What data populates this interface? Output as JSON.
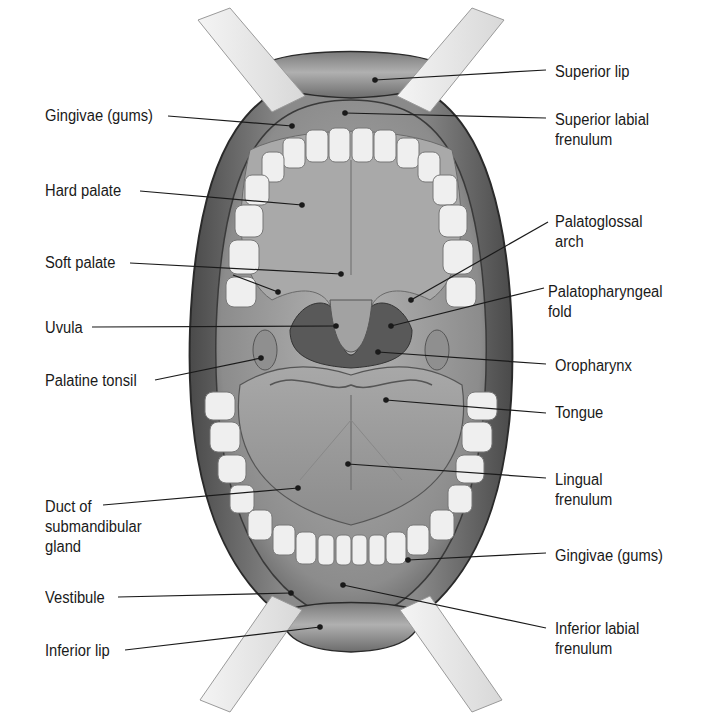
{
  "figure": {
    "colors": {
      "background": "#ffffff",
      "lip": "#8a8a8a",
      "cheek_wall": "#6e6e6e",
      "palate": "#a6a6a6",
      "oropharynx": "#5a5a5a",
      "tongue": "#9b9b9b",
      "teeth": "#efefef",
      "retractor": "#e2e2e2",
      "leader_line": "#1a1a1a",
      "label_text": "#1a1a1a"
    }
  },
  "labels": {
    "left": [
      {
        "id": "gingivae_upper",
        "text": "Gingivae (gums)",
        "x": 45,
        "y": 106,
        "line": [
          168,
          116,
          292,
          126
        ]
      },
      {
        "id": "hard_palate",
        "text": "Hard palate",
        "x": 45,
        "y": 181,
        "line": [
          140,
          191,
          302,
          205
        ]
      },
      {
        "id": "soft_palate",
        "text": "Soft palate",
        "x": 45,
        "y": 253,
        "line": [
          130,
          263,
          341,
          274
        ],
        "line2": [
          233,
          275,
          278,
          292
        ]
      },
      {
        "id": "uvula",
        "text": "Uvula",
        "x": 45,
        "y": 318,
        "line": [
          92,
          327,
          336,
          326
        ]
      },
      {
        "id": "palatine_tonsil",
        "text": "Palatine tonsil",
        "x": 45,
        "y": 371,
        "line": [
          155,
          380,
          261,
          358
        ]
      },
      {
        "id": "duct_submandibular",
        "text": "Duct of\nsubmandibular\ngland",
        "x": 45,
        "y": 497,
        "line": [
          103,
          505,
          298,
          488
        ]
      },
      {
        "id": "vestibule",
        "text": "Vestibule",
        "x": 45,
        "y": 588,
        "line": [
          118,
          597,
          291,
          593
        ]
      },
      {
        "id": "inferior_lip",
        "text": "Inferior lip",
        "x": 45,
        "y": 641,
        "line": [
          125,
          650,
          320,
          627
        ]
      }
    ],
    "right": [
      {
        "id": "superior_lip",
        "text": "Superior lip",
        "x": 555,
        "y": 62,
        "line": [
          375,
          80,
          546,
          70
        ]
      },
      {
        "id": "superior_labial_frenulum",
        "text": "Superior labial\nfrenulum",
        "x": 555,
        "y": 110,
        "line": [
          345,
          113,
          546,
          118
        ]
      },
      {
        "id": "palatoglossal_arch",
        "text": "Palatoglossal\narch",
        "x": 555,
        "y": 212,
        "line": [
          411,
          300,
          548,
          222
        ]
      },
      {
        "id": "palatopharyngeal_fold",
        "text": "Palatopharyngeal\nfold",
        "x": 548,
        "y": 282,
        "line": [
          391,
          326,
          544,
          288
        ]
      },
      {
        "id": "oropharynx",
        "text": "Oropharynx",
        "x": 555,
        "y": 356,
        "line": [
          378,
          352,
          546,
          364
        ]
      },
      {
        "id": "tongue",
        "text": "Tongue",
        "x": 555,
        "y": 403,
        "line": [
          386,
          400,
          546,
          413
        ]
      },
      {
        "id": "lingual_frenulum",
        "text": "Lingual\nfrenulum",
        "x": 555,
        "y": 470,
        "line": [
          348,
          464,
          546,
          478
        ]
      },
      {
        "id": "gingivae_lower",
        "text": "Gingivae (gums)",
        "x": 555,
        "y": 546,
        "line": [
          408,
          560,
          546,
          553
        ]
      },
      {
        "id": "inferior_labial_frenulum",
        "text": "Inferior labial\nfrenulum",
        "x": 555,
        "y": 619,
        "line": [
          343,
          585,
          546,
          628
        ]
      }
    ]
  }
}
